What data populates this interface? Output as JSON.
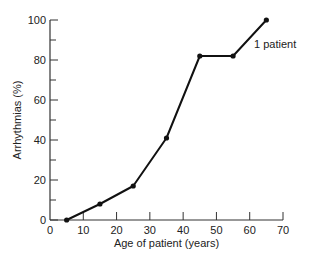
{
  "chart_data": {
    "type": "line",
    "title": "",
    "xlabel": "Age of patient (years)",
    "ylabel": "Arrhythmias (%)",
    "xlim": [
      0,
      70
    ],
    "ylim": [
      0,
      100
    ],
    "x_ticks": [
      0,
      10,
      20,
      30,
      40,
      50,
      60,
      70
    ],
    "y_ticks": [
      0,
      20,
      40,
      60,
      80,
      100
    ],
    "y_minor_ticks": [
      10,
      30,
      50,
      70,
      90
    ],
    "grid": false,
    "legend": null,
    "series": [
      {
        "name": "Arrhythmias",
        "x": [
          5,
          15,
          25,
          35,
          45,
          55,
          65
        ],
        "values": [
          0,
          8,
          17,
          41,
          82,
          82,
          100
        ],
        "color": "#111111",
        "marker": "circle"
      }
    ],
    "annotations": [
      {
        "text": "1 patient",
        "x": 57,
        "y": 90
      }
    ]
  }
}
